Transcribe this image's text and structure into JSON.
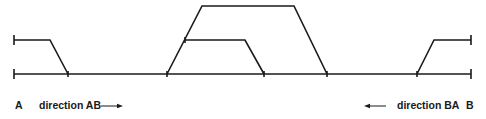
{
  "diagram": {
    "type": "railway track layout",
    "endpoints": {
      "left": "A",
      "right": "B"
    },
    "directions": {
      "ab": {
        "label": "direction AB",
        "arrow": "right-arrow"
      },
      "ba": {
        "label": "direction BA",
        "arrow": "left-arrow"
      }
    },
    "colors": {
      "track": "#1a1a1a",
      "background": "#ffffff"
    },
    "tracks": [
      {
        "id": "main-line",
        "points": [
          [
            14,
            74
          ],
          [
            471,
            74
          ]
        ]
      },
      {
        "id": "left-siding",
        "points": [
          [
            14,
            40
          ],
          [
            50,
            40
          ],
          [
            68,
            74
          ]
        ]
      },
      {
        "id": "outer-loop",
        "points": [
          [
            167,
            74
          ],
          [
            202,
            6
          ],
          [
            294,
            6
          ],
          [
            327,
            74
          ]
        ]
      },
      {
        "id": "inner-loop",
        "points": [
          [
            185,
            40
          ],
          [
            245,
            40
          ],
          [
            264,
            74
          ]
        ]
      },
      {
        "id": "right-siding",
        "points": [
          [
            417,
            74
          ],
          [
            434,
            40
          ],
          [
            471,
            40
          ]
        ]
      }
    ],
    "switches_x": [
      68,
      167,
      185,
      264,
      327,
      417
    ]
  }
}
